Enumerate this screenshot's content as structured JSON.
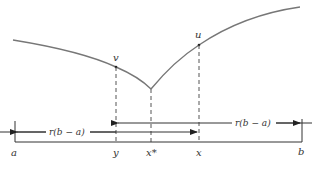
{
  "diagram": {
    "type": "golden-section-search-illustration",
    "curve": {
      "description": "unimodal function with cusp minimum at x*",
      "color": "#777777"
    },
    "points": {
      "v": {
        "label": "v"
      },
      "u": {
        "label": "u"
      }
    },
    "axis_labels": {
      "a": "a",
      "y": "y",
      "x_star": "x*",
      "x": "x",
      "b": "b"
    },
    "intervals": {
      "left_span": {
        "label": "r(b − a)",
        "from": "a",
        "to": "x",
        "arrow_direction": "left"
      },
      "right_span": {
        "label": "r(b − a)",
        "from": "y",
        "to": "b",
        "arrow_direction": "right"
      }
    },
    "colors": {
      "line": "#333333",
      "curve": "#777777",
      "dashed": "#555555"
    }
  }
}
